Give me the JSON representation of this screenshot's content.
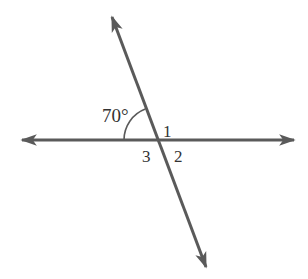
{
  "diagram": {
    "type": "intersecting-lines",
    "background": "#ffffff",
    "line_color": "#5a5a5a",
    "text_color": "#333333",
    "intersection": {
      "x": 157,
      "y": 141
    },
    "horizontal_line": {
      "x1": 19,
      "y1": 140,
      "x2": 297,
      "y2": 140,
      "arrows": "both"
    },
    "transversal_line": {
      "x1": 111,
      "y1": 14,
      "x2": 207,
      "y2": 270,
      "arrows": "both"
    },
    "angle_arc": {
      "measure_label": "70°",
      "degrees": 70
    },
    "labels": {
      "angle_given": "70°",
      "angle_1": "1",
      "angle_2": "2",
      "angle_3": "3"
    }
  }
}
